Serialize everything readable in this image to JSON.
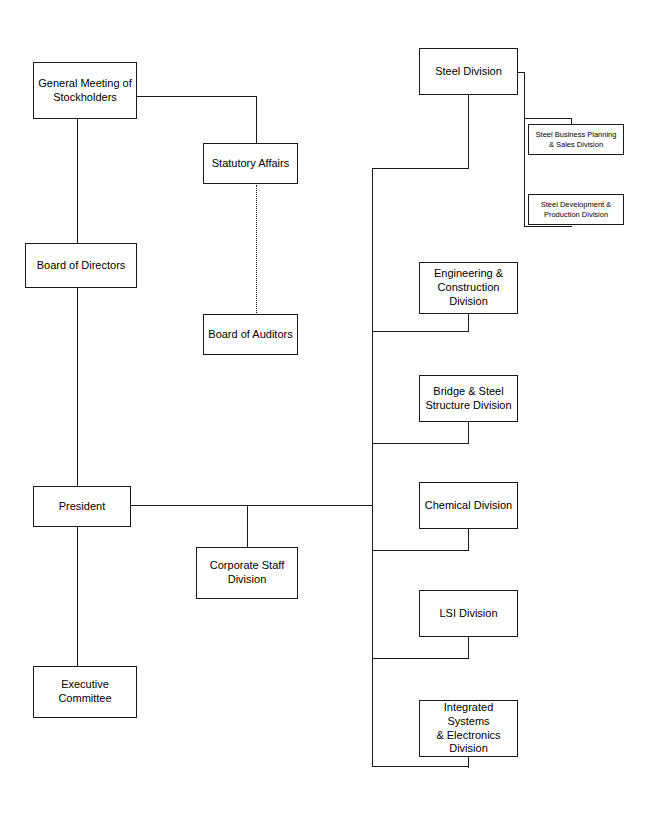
{
  "chart_data": {
    "type": "diagram",
    "nodes": [
      {
        "id": "general_meeting",
        "label": "General Meeting of\nStockholders",
        "x": 33,
        "y": 62,
        "w": 104,
        "h": 57,
        "level": "main"
      },
      {
        "id": "statutory_affairs",
        "label": "Statutory Affairs",
        "x": 203,
        "y": 143,
        "w": 95,
        "h": 41,
        "level": "main"
      },
      {
        "id": "board_auditors",
        "label": "Board of Auditors",
        "x": 203,
        "y": 314,
        "w": 95,
        "h": 41,
        "level": "main"
      },
      {
        "id": "board_directors",
        "label": "Board of Directors",
        "x": 25,
        "y": 243,
        "w": 112,
        "h": 45,
        "level": "main"
      },
      {
        "id": "president",
        "label": "President",
        "x": 33,
        "y": 486,
        "w": 98,
        "h": 41,
        "level": "main"
      },
      {
        "id": "corporate_staff",
        "label": "Corporate Staff\nDivision",
        "x": 196,
        "y": 547,
        "w": 102,
        "h": 52,
        "level": "main"
      },
      {
        "id": "executive_comm",
        "label": "Executive\nCommittee",
        "x": 33,
        "y": 666,
        "w": 104,
        "h": 52,
        "level": "main"
      },
      {
        "id": "steel",
        "label": "Steel Division",
        "x": 419,
        "y": 48,
        "w": 99,
        "h": 47,
        "level": "main"
      },
      {
        "id": "steel_planning",
        "label": "Steel Business Planning\n& Sales Division",
        "x": 528,
        "y": 124,
        "w": 96,
        "h": 31,
        "level": "sub"
      },
      {
        "id": "steel_production",
        "label": "Steel Development &\nProduction Division",
        "x": 528,
        "y": 194,
        "w": 96,
        "h": 31,
        "level": "sub"
      },
      {
        "id": "engineering",
        "label": "Engineering &\nConstruction\nDivision",
        "x": 419,
        "y": 262,
        "w": 99,
        "h": 52,
        "level": "main"
      },
      {
        "id": "bridge",
        "label": "Bridge & Steel\nStructure Division",
        "x": 419,
        "y": 375,
        "w": 99,
        "h": 47,
        "level": "main"
      },
      {
        "id": "chemical",
        "label": "Chemical Division",
        "x": 419,
        "y": 482,
        "w": 99,
        "h": 47,
        "level": "main"
      },
      {
        "id": "lsi",
        "label": "LSI Division",
        "x": 419,
        "y": 590,
        "w": 99,
        "h": 47,
        "level": "main"
      },
      {
        "id": "integrated",
        "label": "Integrated Systems\n& Electronics\nDivision",
        "x": 419,
        "y": 700,
        "w": 99,
        "h": 57,
        "level": "main"
      }
    ],
    "connections": [
      {
        "from": "general_meeting",
        "to": "statutory_affairs",
        "style": "solid"
      },
      {
        "from": "general_meeting",
        "to": "board_directors",
        "style": "solid"
      },
      {
        "from": "statutory_affairs",
        "to": "board_auditors",
        "style": "dotted"
      },
      {
        "from": "board_directors",
        "to": "president",
        "style": "solid"
      },
      {
        "from": "president",
        "to": "executive_comm",
        "style": "solid"
      },
      {
        "from": "president",
        "to": "corporate_staff",
        "style": "solid"
      },
      {
        "from": "president",
        "to": "division_spine",
        "style": "solid"
      },
      {
        "from": "division_spine",
        "to": "steel",
        "style": "solid"
      },
      {
        "from": "division_spine",
        "to": "engineering",
        "style": "solid"
      },
      {
        "from": "division_spine",
        "to": "bridge",
        "style": "solid"
      },
      {
        "from": "division_spine",
        "to": "chemical",
        "style": "solid"
      },
      {
        "from": "division_spine",
        "to": "lsi",
        "style": "solid"
      },
      {
        "from": "division_spine",
        "to": "integrated",
        "style": "solid"
      },
      {
        "from": "steel",
        "to": "steel_planning",
        "style": "solid"
      },
      {
        "from": "steel",
        "to": "steel_production",
        "style": "solid"
      }
    ],
    "edges_geometry": [
      {
        "id": "gm-right-to-sa",
        "type": "h",
        "x": 137,
        "y": 96,
        "len": 120
      },
      {
        "id": "sa-drop",
        "type": "v",
        "x": 256,
        "y": 96,
        "len": 48
      },
      {
        "id": "gm-down-to-bod",
        "type": "v",
        "x": 77,
        "y": 119,
        "len": 125
      },
      {
        "id": "sa-auditors-dotted",
        "type": "d",
        "x": 256,
        "y": 185,
        "len": 130
      },
      {
        "id": "bod-down-to-pres",
        "type": "v",
        "x": 77,
        "y": 288,
        "len": 199
      },
      {
        "id": "pres-down-to-exec",
        "type": "v",
        "x": 77,
        "y": 527,
        "len": 140
      },
      {
        "id": "pres-right-main",
        "type": "h",
        "x": 131,
        "y": 505,
        "len": 242
      },
      {
        "id": "corp-staff-drop",
        "type": "v",
        "x": 247,
        "y": 505,
        "len": 43
      },
      {
        "id": "spine-main",
        "type": "v",
        "x": 372,
        "y": 168,
        "len": 598
      },
      {
        "id": "spine-to-steel",
        "type": "h",
        "x": 372,
        "y": 168,
        "len": 97
      },
      {
        "id": "steel-bottom-drop",
        "type": "v",
        "x": 468,
        "y": 95,
        "len": 74
      },
      {
        "id": "steel-right-out",
        "type": "h",
        "x": 518,
        "y": 72,
        "len": 7
      },
      {
        "id": "steel-sub-spine",
        "type": "v",
        "x": 524,
        "y": 72,
        "len": 155
      },
      {
        "id": "steel-sub-bottom",
        "type": "h",
        "x": 524,
        "y": 226,
        "len": 48
      },
      {
        "id": "steel-sub1-up",
        "type": "v",
        "x": 571,
        "y": 118,
        "len": 8
      },
      {
        "id": "steel-sub1-in",
        "type": "h",
        "x": 524,
        "y": 118,
        "len": 48
      },
      {
        "id": "eng-bottom-drop",
        "type": "v",
        "x": 468,
        "y": 314,
        "len": 18
      },
      {
        "id": "eng-to-spine",
        "type": "h",
        "x": 372,
        "y": 331,
        "len": 97
      },
      {
        "id": "bridge-bottom-drop",
        "type": "v",
        "x": 468,
        "y": 422,
        "len": 22
      },
      {
        "id": "bridge-to-spine",
        "type": "h",
        "x": 372,
        "y": 443,
        "len": 97
      },
      {
        "id": "chem-bottom-drop",
        "type": "v",
        "x": 468,
        "y": 529,
        "len": 22
      },
      {
        "id": "chem-to-spine",
        "type": "h",
        "x": 372,
        "y": 550,
        "len": 97
      },
      {
        "id": "lsi-bottom-drop",
        "type": "v",
        "x": 468,
        "y": 637,
        "len": 22
      },
      {
        "id": "lsi-to-spine",
        "type": "h",
        "x": 372,
        "y": 658,
        "len": 97
      },
      {
        "id": "int-bottom-drop",
        "type": "v",
        "x": 468,
        "y": 757,
        "len": 11
      },
      {
        "id": "int-to-spine",
        "type": "h",
        "x": 372,
        "y": 766,
        "len": 97
      }
    ],
    "colors": {
      "stroke": "#1a1a1a",
      "fill": "#ffffff",
      "background": "#ffffff",
      "text": "#000000"
    },
    "layout": {
      "width": 653,
      "height": 819
    }
  }
}
